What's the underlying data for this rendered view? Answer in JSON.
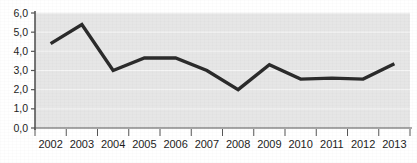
{
  "chart_data": {
    "type": "line",
    "title": "",
    "subtitle": "",
    "xlabel": "",
    "ylabel": "",
    "categories": [
      "2002",
      "2003",
      "2004",
      "2005",
      "2006",
      "2007",
      "2008",
      "2009",
      "2010",
      "2011",
      "2012",
      "2013"
    ],
    "values": [
      4.4,
      5.4,
      3.0,
      3.65,
      3.65,
      3.0,
      2.0,
      3.3,
      2.55,
      2.6,
      2.55,
      3.35
    ],
    "series": [
      {
        "name": "",
        "values": [
          4.4,
          5.4,
          3.0,
          3.65,
          3.65,
          3.0,
          2.0,
          3.3,
          2.55,
          2.6,
          2.55,
          3.35
        ]
      }
    ],
    "ylim": [
      0.0,
      6.0
    ],
    "ytick_step": 1.0,
    "ytick_labels": [
      "0,0",
      "1,0",
      "2,0",
      "3,0",
      "4,0",
      "5,0",
      "6,0"
    ],
    "ytick_values": [
      0.0,
      1.0,
      2.0,
      3.0,
      4.0,
      5.0,
      6.0
    ],
    "xtick_labels": [
      "2002",
      "2003",
      "2004",
      "2005",
      "2006",
      "2007",
      "2008",
      "2009",
      "2010",
      "2011",
      "2012",
      "2013"
    ],
    "grid": true,
    "grid_axis": "y",
    "legend": false,
    "legend_position": "none",
    "decimal_separator": ",",
    "annotations": []
  },
  "style": {
    "line_color": "#2b2b2b",
    "plot_background": "#e6e6e6",
    "page_background": "#ffffff",
    "grid_color": "#f5f5f5",
    "axis_color": "#555555",
    "tick_label_color": "#1d1d1d"
  },
  "axis": {
    "y_label_0": "0,0",
    "y_label_1": "1,0",
    "y_label_2": "2,0",
    "y_label_3": "3,0",
    "y_label_4": "4,0",
    "y_label_5": "5,0",
    "y_label_6": "6,0",
    "x_label_0": "2002",
    "x_label_1": "2003",
    "x_label_2": "2004",
    "x_label_3": "2005",
    "x_label_4": "2006",
    "x_label_5": "2007",
    "x_label_6": "2008",
    "x_label_7": "2009",
    "x_label_8": "2010",
    "x_label_9": "2011",
    "x_label_10": "2012",
    "x_label_11": "2013"
  }
}
